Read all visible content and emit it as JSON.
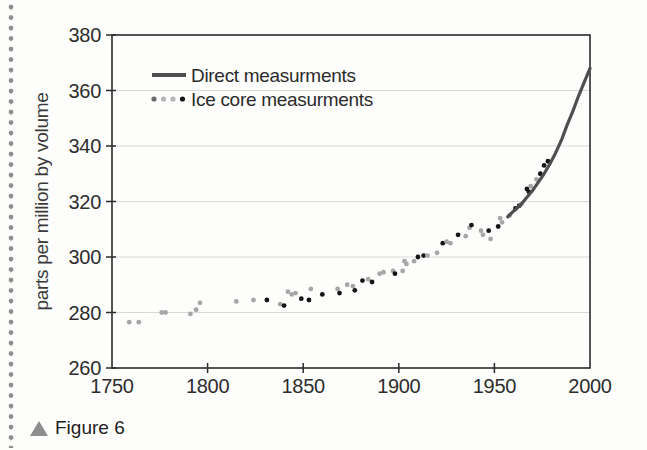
{
  "caption": {
    "marker": "triangle-up",
    "text": "Figure 6"
  },
  "chart_data": {
    "type": "scatter",
    "title": "",
    "xlabel": "",
    "ylabel": "parts per million by volume",
    "xlim": [
      1750,
      2000
    ],
    "ylim": [
      260,
      380
    ],
    "x_ticks": [
      1750,
      1800,
      1850,
      1900,
      1950,
      2000
    ],
    "y_ticks": [
      260,
      280,
      300,
      320,
      340,
      360,
      380
    ],
    "grid": "horizontal-only",
    "legend": {
      "position": "top-left-inside",
      "entries": [
        {
          "label": "Direct measurments",
          "type": "line",
          "color": "#4f4f4f"
        },
        {
          "label": "Ice core measurments",
          "type": "dots",
          "colors": [
            "#6a6a6a",
            "#b5b5b5",
            "#b5b5b5",
            "#161616"
          ]
        }
      ]
    },
    "colors": {
      "line": "#4f4f4f",
      "scatter_gray": "#a6a6a6",
      "scatter_black": "#151515",
      "grid": "#d9d9d9",
      "axis": "#2b2b2b"
    },
    "series": [
      {
        "name": "Direct measurments",
        "type": "line",
        "points": [
          [
            1957,
            314.5
          ],
          [
            1960,
            316.5
          ],
          [
            1964,
            319
          ],
          [
            1967,
            321.5
          ],
          [
            1970,
            324
          ],
          [
            1973,
            327
          ],
          [
            1976,
            330
          ],
          [
            1979,
            333.5
          ],
          [
            1982,
            337.5
          ],
          [
            1985,
            342
          ],
          [
            1988,
            347.5
          ],
          [
            1991,
            352.5
          ],
          [
            1994,
            358
          ],
          [
            1997,
            363
          ],
          [
            2000,
            368
          ]
        ]
      },
      {
        "name": "Ice core measurments",
        "type": "scatter",
        "point_format": "[year, ppmv, shade g=gray b=black]",
        "points": [
          [
            1759,
            276.5,
            "g"
          ],
          [
            1764,
            276.5,
            "g"
          ],
          [
            1776,
            280,
            "g"
          ],
          [
            1778,
            280,
            "g"
          ],
          [
            1791,
            279.5,
            "g"
          ],
          [
            1794,
            281,
            "g"
          ],
          [
            1796,
            283.5,
            "g"
          ],
          [
            1815,
            284,
            "g"
          ],
          [
            1824,
            284.5,
            "g"
          ],
          [
            1831,
            284.5,
            "b"
          ],
          [
            1838,
            283,
            "g"
          ],
          [
            1840,
            282.5,
            "b"
          ],
          [
            1842,
            287.5,
            "g"
          ],
          [
            1844,
            286.5,
            "g"
          ],
          [
            1846,
            287,
            "g"
          ],
          [
            1849,
            285,
            "b"
          ],
          [
            1853,
            284.5,
            "b"
          ],
          [
            1854,
            288.5,
            "g"
          ],
          [
            1860,
            286.5,
            "b"
          ],
          [
            1868,
            288.5,
            "g"
          ],
          [
            1869,
            287,
            "b"
          ],
          [
            1873,
            290,
            "g"
          ],
          [
            1876,
            289.5,
            "g"
          ],
          [
            1877,
            288,
            "b"
          ],
          [
            1881,
            291.5,
            "b"
          ],
          [
            1884,
            292,
            "g"
          ],
          [
            1886,
            291,
            "b"
          ],
          [
            1890,
            294,
            "g"
          ],
          [
            1892,
            294.5,
            "g"
          ],
          [
            1897,
            295,
            "g"
          ],
          [
            1898,
            294,
            "b"
          ],
          [
            1902,
            295,
            "g"
          ],
          [
            1903,
            298.5,
            "g"
          ],
          [
            1904,
            297.5,
            "g"
          ],
          [
            1908,
            298.5,
            "g"
          ],
          [
            1910,
            300,
            "b"
          ],
          [
            1913,
            300.5,
            "b"
          ],
          [
            1915,
            300.5,
            "g"
          ],
          [
            1920,
            301.5,
            "g"
          ],
          [
            1923,
            305,
            "b"
          ],
          [
            1925,
            305.5,
            "g"
          ],
          [
            1927,
            305,
            "g"
          ],
          [
            1931,
            308,
            "b"
          ],
          [
            1935,
            307.5,
            "g"
          ],
          [
            1937,
            310.5,
            "g"
          ],
          [
            1938,
            311.5,
            "b"
          ],
          [
            1943,
            309.5,
            "g"
          ],
          [
            1944,
            308,
            "g"
          ],
          [
            1947,
            309.5,
            "b"
          ],
          [
            1948,
            306.5,
            "g"
          ],
          [
            1952,
            311,
            "b"
          ],
          [
            1953,
            314,
            "g"
          ],
          [
            1954,
            312.5,
            "g"
          ],
          [
            1958,
            315,
            "g"
          ],
          [
            1961,
            317.5,
            "b"
          ],
          [
            1963,
            318.5,
            "b"
          ],
          [
            1964,
            319,
            "g"
          ],
          [
            1967,
            324.5,
            "b"
          ],
          [
            1968,
            323.5,
            "b"
          ],
          [
            1969,
            325.5,
            "g"
          ],
          [
            1972,
            328,
            "g"
          ],
          [
            1974,
            330,
            "b"
          ],
          [
            1976,
            333,
            "b"
          ],
          [
            1978,
            334.5,
            "b"
          ]
        ]
      }
    ]
  }
}
